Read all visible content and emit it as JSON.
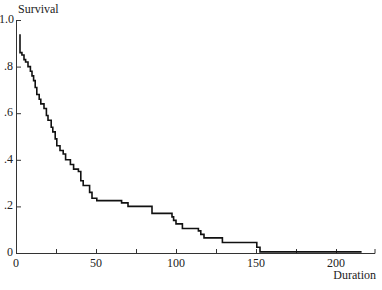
{
  "chart_data": {
    "type": "line",
    "subtype": "step (Kaplan-Meier survival curve)",
    "title": "",
    "xlabel": "Duration",
    "ylabel": "Survival",
    "xlim": [
      0,
      225
    ],
    "ylim": [
      0,
      1.0
    ],
    "grid": false,
    "legend": null,
    "x_ticks": [
      0,
      25,
      50,
      75,
      100,
      125,
      150,
      175,
      200
    ],
    "x_tick_labels": [
      {
        "value": 0,
        "label": "0"
      },
      {
        "value": 50,
        "label": "50"
      },
      {
        "value": 100,
        "label": "100"
      },
      {
        "value": 150,
        "label": "150"
      },
      {
        "value": 200,
        "label": "200"
      }
    ],
    "y_tick_labels": [
      {
        "value": 0,
        "label": "0"
      },
      {
        "value": 0.2,
        "label": ".2"
      },
      {
        "value": 0.4,
        "label": ".4"
      },
      {
        "value": 0.6,
        "label": ".6"
      },
      {
        "value": 0.8,
        "label": ".8"
      },
      {
        "value": 1.0,
        "label": "1.0"
      }
    ],
    "series": [
      {
        "name": "Survival",
        "color": "#111111",
        "x": [
          2,
          2.5,
          3.7,
          5,
          6,
          7.5,
          9,
          10,
          11,
          12,
          13,
          14.5,
          15.5,
          17.5,
          19,
          20,
          22,
          23,
          24.5,
          25.5,
          27.5,
          29.5,
          31,
          34,
          36,
          39,
          40.5,
          42,
          46,
          47.5,
          50.5,
          66,
          70,
          85,
          97.5,
          98.5,
          100,
          104,
          114,
          115.5,
          117.5,
          129,
          150.5,
          152.5,
          216
        ],
        "y": [
          0.935,
          0.86,
          0.85,
          0.83,
          0.82,
          0.8,
          0.78,
          0.76,
          0.74,
          0.71,
          0.68,
          0.66,
          0.64,
          0.62,
          0.59,
          0.57,
          0.54,
          0.52,
          0.49,
          0.46,
          0.44,
          0.425,
          0.4,
          0.38,
          0.36,
          0.35,
          0.31,
          0.29,
          0.26,
          0.235,
          0.225,
          0.215,
          0.2,
          0.17,
          0.155,
          0.14,
          0.125,
          0.105,
          0.095,
          0.08,
          0.065,
          0.045,
          0.025,
          0.005,
          0.005
        ]
      }
    ]
  },
  "labels": {
    "ylabel": "Survival",
    "xlabel": "Duration"
  },
  "colors": {
    "line": "#111111",
    "axis": "#333333"
  }
}
